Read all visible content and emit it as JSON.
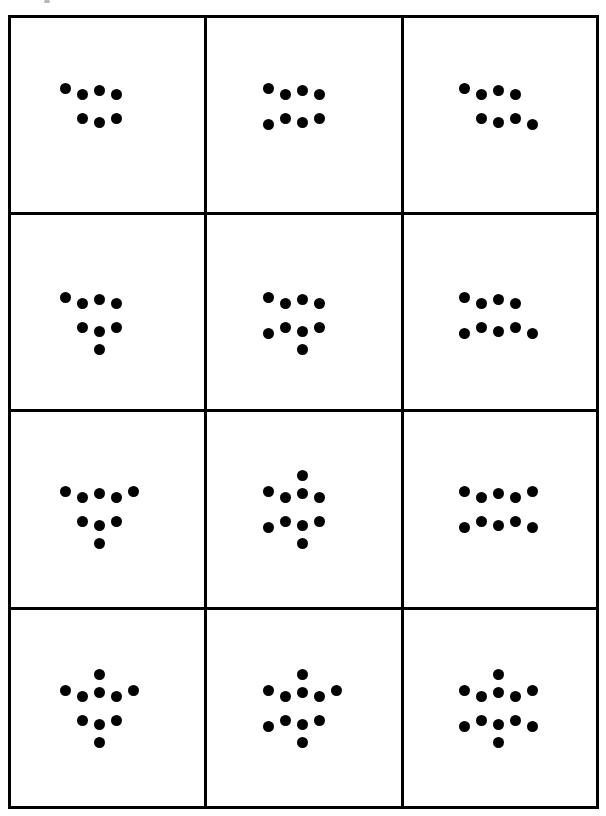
{
  "figure": {
    "title": "",
    "rows": 4,
    "cols": 3,
    "dot_color": "#000000",
    "grid_line_color": "#000000",
    "background": "#ffffff",
    "hexagon_offsets": [
      [
        -17,
        -12
      ],
      [
        0,
        -16
      ],
      [
        17,
        -12
      ],
      [
        -17,
        12
      ],
      [
        0,
        16
      ],
      [
        17,
        12
      ]
    ],
    "arm_offsets": {
      "TL": [
        -34,
        -18
      ],
      "T": [
        0,
        -34
      ],
      "TR": [
        34,
        -18
      ],
      "BL": [
        -34,
        18
      ],
      "B": [
        0,
        34
      ],
      "BR": [
        34,
        18
      ]
    },
    "cells": [
      {
        "id": "r1c1",
        "center": [
          96,
          100
        ],
        "arms": [
          "TL"
        ],
        "dot_count": 7
      },
      {
        "id": "r1c2",
        "center": [
          295,
          100
        ],
        "arms": [
          "TL",
          "BL"
        ],
        "dot_count": 8
      },
      {
        "id": "r1c3",
        "center": [
          500,
          100
        ],
        "arms": [
          "TL",
          "BR"
        ],
        "dot_count": 8
      },
      {
        "id": "r2c1",
        "center": [
          96,
          98
        ],
        "arms": [
          "TL",
          "B"
        ],
        "dot_count": 8
      },
      {
        "id": "r2c2",
        "center": [
          295,
          98
        ],
        "arms": [
          "TL",
          "BL",
          "B"
        ],
        "dot_count": 9
      },
      {
        "id": "r2c3",
        "center": [
          500,
          98
        ],
        "arms": [
          "TL",
          "BL",
          "BR"
        ],
        "dot_count": 9
      },
      {
        "id": "r3c1",
        "center": [
          96,
          95
        ],
        "arms": [
          "TL",
          "TR",
          "B"
        ],
        "dot_count": 9
      },
      {
        "id": "r3c2",
        "center": [
          295,
          95
        ],
        "arms": [
          "T",
          "TL",
          "BL",
          "B"
        ],
        "dot_count": 10
      },
      {
        "id": "r3c3",
        "center": [
          500,
          95
        ],
        "arms": [
          "TL",
          "TR",
          "BL",
          "BR"
        ],
        "dot_count": 10
      },
      {
        "id": "r4c1",
        "center": [
          96,
          98
        ],
        "arms": [
          "T",
          "TL",
          "TR",
          "B"
        ],
        "dot_count": 10
      },
      {
        "id": "r4c2",
        "center": [
          295,
          98
        ],
        "arms": [
          "T",
          "TL",
          "TR",
          "BL",
          "B"
        ],
        "dot_count": 11
      },
      {
        "id": "r4c3",
        "center": [
          500,
          98
        ],
        "arms": [
          "T",
          "TL",
          "TR",
          "BL",
          "B",
          "BR"
        ],
        "dot_count": 12
      }
    ]
  }
}
